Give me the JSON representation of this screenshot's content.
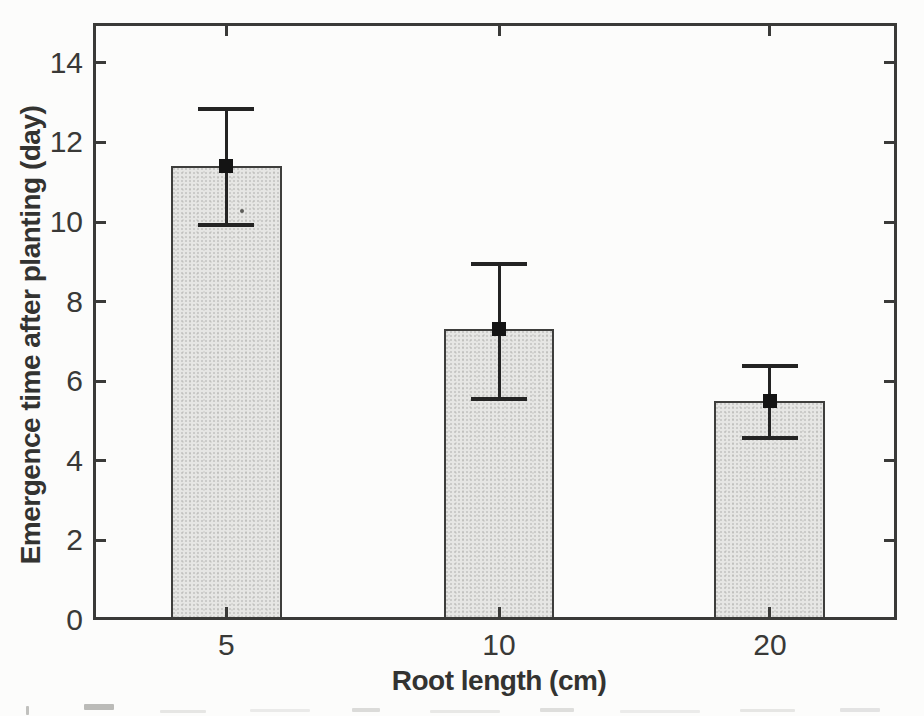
{
  "chart_data": {
    "type": "bar",
    "categories": [
      "5",
      "10",
      "20"
    ],
    "values": [
      11.4,
      7.3,
      5.5
    ],
    "error_high": [
      12.85,
      8.95,
      6.4
    ],
    "error_low": [
      9.9,
      5.55,
      4.55
    ],
    "title": "",
    "xlabel": "Root length (cm)",
    "ylabel": "Emergence time after planting (day)",
    "ylim": [
      0,
      15
    ],
    "yticks": [
      0,
      2,
      4,
      6,
      8,
      10,
      12,
      14
    ],
    "grid": false,
    "legend": null,
    "marker": "filled-square",
    "tick_style": "inward-all-four-sides",
    "colors": {
      "bar_fill": "#e6e6e4",
      "bar_border": "#3e3e3c",
      "axis": "#3a3a38",
      "error_bar": "#232323",
      "marker": "#141414",
      "text": "#393937"
    },
    "x_center_fractions": [
      0.166,
      0.505,
      0.842
    ],
    "bar_width_frac": 0.138
  }
}
